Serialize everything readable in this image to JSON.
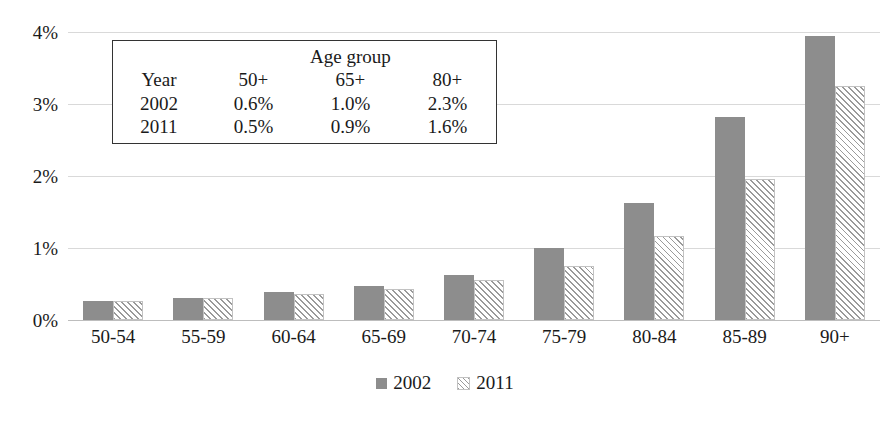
{
  "chart_data": {
    "type": "bar",
    "title": "",
    "subtitle": "",
    "xlabel": "",
    "ylabel": "",
    "ylim": [
      0,
      4
    ],
    "ytick_labels": [
      "0%",
      "1%",
      "2%",
      "3%",
      "4%"
    ],
    "ytick_values": [
      0,
      1,
      2,
      3,
      4
    ],
    "grid": true,
    "legend_position": "bottom",
    "categories": [
      "50-54",
      "55-59",
      "60-64",
      "65-69",
      "70-74",
      "75-79",
      "80-84",
      "85-89",
      "90+"
    ],
    "series": [
      {
        "name": "2002",
        "fill": "solid",
        "color": "#8d8d8d",
        "values": [
          0.26,
          0.31,
          0.39,
          0.47,
          0.63,
          1.0,
          1.62,
          2.82,
          3.95
        ]
      },
      {
        "name": "2011",
        "fill": "diagonal-hatch",
        "color": "#9a9a9a",
        "values": [
          0.26,
          0.3,
          0.36,
          0.43,
          0.56,
          0.75,
          1.17,
          1.96,
          3.25
        ]
      }
    ],
    "annotations": {
      "inset_table": {
        "span_header": "Age group",
        "columns": [
          "Year",
          "50+",
          "65+",
          "80+"
        ],
        "rows": [
          [
            "2002",
            "0.6%",
            "1.0%",
            "2.3%"
          ],
          [
            "2011",
            "0.5%",
            "0.9%",
            "1.6%"
          ]
        ]
      }
    }
  },
  "legend": {
    "items": [
      {
        "label": "2002"
      },
      {
        "label": "2011"
      }
    ]
  }
}
